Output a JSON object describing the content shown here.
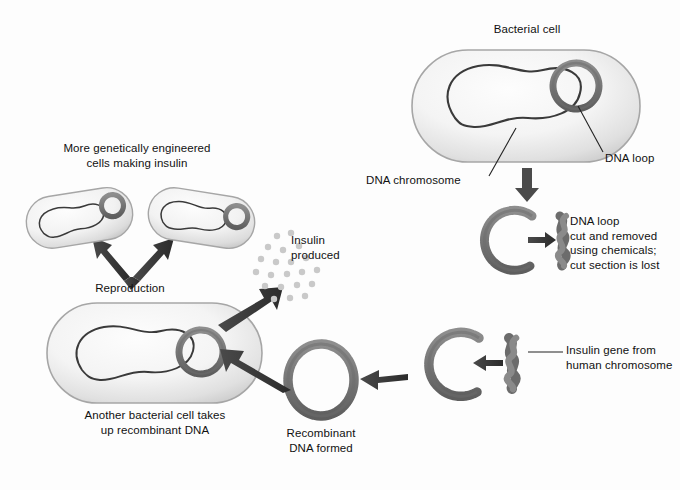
{
  "figure": {
    "width": 680,
    "height": 490,
    "background_color": "#fdfdfd"
  },
  "colors": {
    "cell_fill_light": "#fbfbfb",
    "cell_fill_mid": "#e2e2e2",
    "cell_edge": "#9a9a9a",
    "chromosome_line": "#3a3a3a",
    "dna_bead": "#7a7a7a",
    "dna_bead_dark": "#5f5f5f",
    "arrow": "#3b3b3b",
    "insulin_dot": "#c9c9c9",
    "text": "#111111",
    "leader_line": "#222222"
  },
  "labels": [
    {
      "id": "bacterial-cell",
      "name": "label-bacterial-cell",
      "text": "Bacterial cell",
      "x": 527,
      "y": 29,
      "align": "center"
    },
    {
      "id": "dna-chromosome",
      "name": "label-dna-chromosome",
      "text": "DNA chromosome",
      "x": 366,
      "y": 180,
      "align": "left"
    },
    {
      "id": "dna-loop",
      "name": "label-dna-loop",
      "text": "DNA loop",
      "x": 605,
      "y": 158,
      "align": "left"
    },
    {
      "id": "dna-loop-cut",
      "name": "label-dna-loop-cut",
      "text": "DNA loop\ncut and removed\nusing chemicals;\ncut section is lost",
      "x": 570,
      "y": 221,
      "align": "left"
    },
    {
      "id": "insulin-gene",
      "name": "label-insulin-gene",
      "text": "Insulin gene from\nhuman chromosome",
      "x": 530,
      "y": 350,
      "align": "left"
    },
    {
      "id": "recombinant-dna",
      "name": "label-recombinant-dna",
      "text": "Recombinant\nDNA formed",
      "x": 321,
      "y": 433,
      "align": "center"
    },
    {
      "id": "another-cell",
      "name": "label-another-bacterial-cell",
      "text": "Another bacterial cell takes\nup recombinant DNA",
      "x": 155,
      "y": 415,
      "align": "center"
    },
    {
      "id": "reproduction",
      "name": "label-reproduction",
      "text": "Reproduction",
      "x": 130,
      "y": 288,
      "align": "center"
    },
    {
      "id": "more-cells",
      "name": "label-more-engineered-cells",
      "text": "More genetically engineered\ncells making insulin",
      "x": 137,
      "y": 148,
      "align": "center"
    },
    {
      "id": "insulin-produced",
      "name": "label-insulin-produced",
      "text": "Insulin\nproduced",
      "x": 291,
      "y": 240,
      "align": "left"
    }
  ],
  "steps": [
    {
      "order": 1,
      "name": "bacterial-cell-with-plasmid",
      "description": "Bacterial cell containing DNA chromosome and DNA loop (plasmid)"
    },
    {
      "order": 2,
      "name": "plasmid-cut-open",
      "description": "DNA loop cut and removed using chemicals; cut section is lost"
    },
    {
      "order": 3,
      "name": "insulin-gene-inserted",
      "description": "Insulin gene from human chromosome inserted into cut DNA loop"
    },
    {
      "order": 4,
      "name": "recombinant-dna-formed",
      "description": "Recombinant DNA formed"
    },
    {
      "order": 5,
      "name": "host-cell-uptake",
      "description": "Another bacterial cell takes up recombinant DNA"
    },
    {
      "order": 6,
      "name": "reproduction",
      "description": "Reproduction produces more genetically engineered cells making insulin"
    },
    {
      "order": 7,
      "name": "insulin-produced",
      "description": "Insulin produced"
    }
  ],
  "shapes": {
    "bacterial_cell_main": {
      "x": 412,
      "y": 50,
      "w": 228,
      "h": 112,
      "rx": 56
    },
    "host_cell": {
      "x": 47,
      "y": 303,
      "w": 215,
      "h": 100,
      "rx": 50
    },
    "daughter_cell_left": {
      "x": 26,
      "y": 192,
      "w": 106,
      "h": 52,
      "rx": 26,
      "rotate": -8
    },
    "daughter_cell_right": {
      "x": 148,
      "y": 192,
      "w": 106,
      "h": 52,
      "rx": 26,
      "rotate": 8
    },
    "plasmid_main": {
      "cx": 576,
      "cy": 86,
      "r": 24
    },
    "plasmid_host": {
      "cx": 201,
      "cy": 352,
      "r": 24
    },
    "plasmid_daughter_left": {
      "cx": 105,
      "cy": 212,
      "r": 12
    },
    "plasmid_daughter_right": {
      "cx": 226,
      "cy": 216,
      "r": 12
    },
    "cut_loop_top": {
      "cx": 516,
      "cy": 240,
      "r": 30
    },
    "cut_loop_bottom": {
      "cx": 455,
      "cy": 364,
      "r": 32
    },
    "recombinant_loop": {
      "cx": 321,
      "cy": 380,
      "r": 33
    },
    "gene_fragment_top": {
      "cx": 553,
      "cy": 240
    },
    "gene_fragment_bottom": {
      "cx": 512,
      "cy": 363
    }
  },
  "insulin_dots": {
    "count": 21,
    "radius": 3.2,
    "color": "#c9c9c9",
    "points": [
      [
        277,
        236
      ],
      [
        291,
        233
      ],
      [
        268,
        247
      ],
      [
        283,
        250
      ],
      [
        299,
        246
      ],
      [
        261,
        259
      ],
      [
        276,
        262
      ],
      [
        291,
        262
      ],
      [
        306,
        258
      ],
      [
        256,
        272
      ],
      [
        271,
        275
      ],
      [
        287,
        274
      ],
      [
        302,
        272
      ],
      [
        317,
        270
      ],
      [
        265,
        286
      ],
      [
        281,
        287
      ],
      [
        297,
        285
      ],
      [
        312,
        284
      ],
      [
        274,
        299
      ],
      [
        290,
        298
      ],
      [
        305,
        296
      ]
    ]
  },
  "arrows": [
    {
      "name": "arrow-cell-to-cut-loop",
      "direction": "down",
      "from": [
        527,
        168
      ],
      "to": [
        527,
        200
      ]
    },
    {
      "name": "arrow-cut-loop-to-fragment",
      "direction": "right",
      "from": [
        531,
        240
      ],
      "to": [
        549,
        240
      ]
    },
    {
      "name": "arrow-gene-into-loop",
      "direction": "left",
      "from": [
        500,
        363
      ],
      "to": [
        471,
        363
      ]
    },
    {
      "name": "arrow-loop-to-recombinant",
      "direction": "left",
      "from": [
        402,
        378
      ],
      "to": [
        361,
        378
      ]
    },
    {
      "name": "arrow-recombinant-to-host-cell",
      "direction": "up-left",
      "from": [
        285,
        391
      ],
      "to": [
        225,
        357
      ]
    },
    {
      "name": "arrow-host-cell-to-insulin",
      "direction": "up-right",
      "from": [
        225,
        320
      ],
      "to": [
        276,
        291
      ]
    },
    {
      "name": "arrow-reproduction-split",
      "direction": "v-split",
      "apex": [
        130,
        275
      ]
    }
  ]
}
